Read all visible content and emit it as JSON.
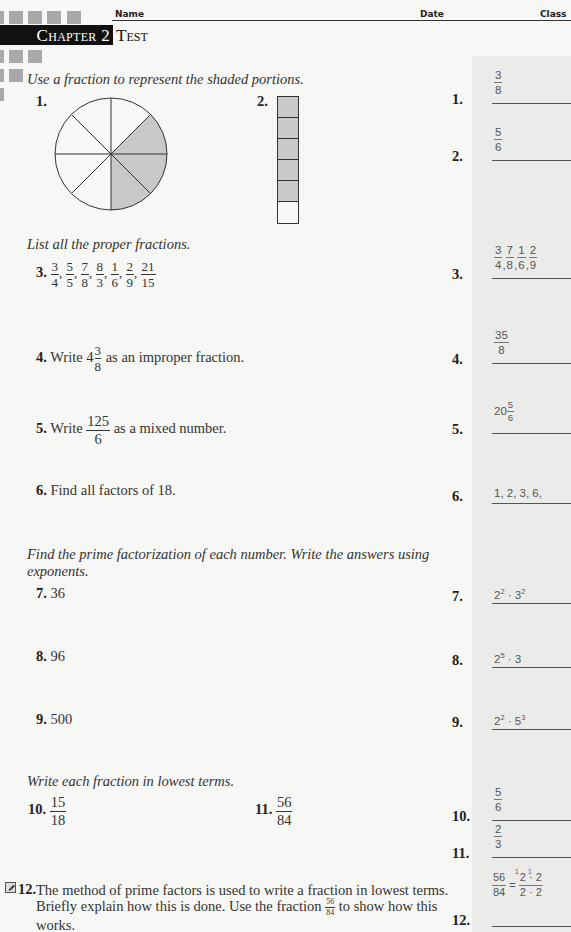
{
  "header": {
    "name_label": "Name",
    "date_label": "Date",
    "class_label": "Class",
    "chapter_label": "Chapter 2",
    "title": "Test"
  },
  "sections": {
    "shaded": {
      "instruction": "Use a fraction to represent the shaded portions."
    },
    "proper": {
      "instruction": "List all the proper fractions."
    },
    "prime": {
      "instruction_line1": "Find the prime factorization of each number. Write the answers using",
      "instruction_line2": "exponents."
    },
    "lowest": {
      "instruction": "Write each fraction in lowest terms."
    }
  },
  "questions": {
    "q1": {
      "number": "1.",
      "figure": "circle-8-slices-3-shaded"
    },
    "q2": {
      "number": "2.",
      "figure": "bar-6-cells-5-shaded"
    },
    "q3": {
      "number": "3.",
      "fractions": [
        {
          "n": "3",
          "d": "4"
        },
        {
          "n": "5",
          "d": "5"
        },
        {
          "n": "7",
          "d": "8"
        },
        {
          "n": "8",
          "d": "3"
        },
        {
          "n": "1",
          "d": "6"
        },
        {
          "n": "2",
          "d": "9"
        },
        {
          "n": "21",
          "d": "15"
        }
      ]
    },
    "q4": {
      "number": "4.",
      "pre": "Write 4",
      "frac_n": "3",
      "frac_d": "8",
      "post": " as an improper fraction."
    },
    "q5": {
      "number": "5.",
      "pre": "Write ",
      "frac_n": "125",
      "frac_d": "6",
      "post": " as a mixed number."
    },
    "q6": {
      "number": "6.",
      "text": "Find all factors of 18."
    },
    "q7": {
      "number": "7.",
      "text": "36"
    },
    "q8": {
      "number": "8.",
      "text": "96"
    },
    "q9": {
      "number": "9.",
      "text": "500"
    },
    "q10": {
      "number": "10.",
      "frac_n": "15",
      "frac_d": "18"
    },
    "q11": {
      "number": "11.",
      "frac_n": "56",
      "frac_d": "84"
    },
    "q12": {
      "number": "12.",
      "text_a": "The method of prime factors is used to write a fraction in lowest terms. Briefly explain how this is done. Use the fraction ",
      "frac_n": "56",
      "frac_d": "84",
      "text_b": " to show how this works."
    }
  },
  "answers": {
    "a1": {
      "label": "1.",
      "n": "3",
      "d": "8"
    },
    "a2": {
      "label": "2.",
      "n": "5",
      "d": "6"
    },
    "a3": {
      "label": "3.",
      "fractions": [
        {
          "n": "3",
          "d": "4"
        },
        {
          "n": "7",
          "d": "8"
        },
        {
          "n": "1",
          "d": "6"
        },
        {
          "n": "2",
          "d": "9"
        }
      ]
    },
    "a4": {
      "label": "4.",
      "n": "35",
      "d": "8"
    },
    "a5": {
      "label": "5.",
      "whole": "20",
      "n": "5",
      "d": "6"
    },
    "a6": {
      "label": "6.",
      "text": "1, 2, 3, 6,"
    },
    "a7": {
      "label": "7.",
      "base1": "2",
      "exp1": "2",
      "sep": " · ",
      "base2": "3",
      "exp2": "2"
    },
    "a8": {
      "label": "8.",
      "base1": "2",
      "exp1": "5",
      "rest": " · 3"
    },
    "a9": {
      "label": "9.",
      "base1": "2",
      "exp1": "2",
      "sep": " · ",
      "base2": "5",
      "exp2": "3"
    },
    "a10": {
      "label": "10.",
      "n": "5",
      "d": "6"
    },
    "a11": {
      "label": "11.",
      "n": "2",
      "d": "3"
    },
    "a12": {
      "label": "12.",
      "lhs_n": "56",
      "lhs_d": "84",
      "eq": "=",
      "rhs_n": "2 · 2",
      "rhs_d": "2 · 2",
      "cancel_mark": "1"
    }
  },
  "colors": {
    "shade": "#c9c9c9",
    "answer_bg": "#ebebe9",
    "chapter_bar": "#111111",
    "deco_squares": "#a9a9a9"
  }
}
